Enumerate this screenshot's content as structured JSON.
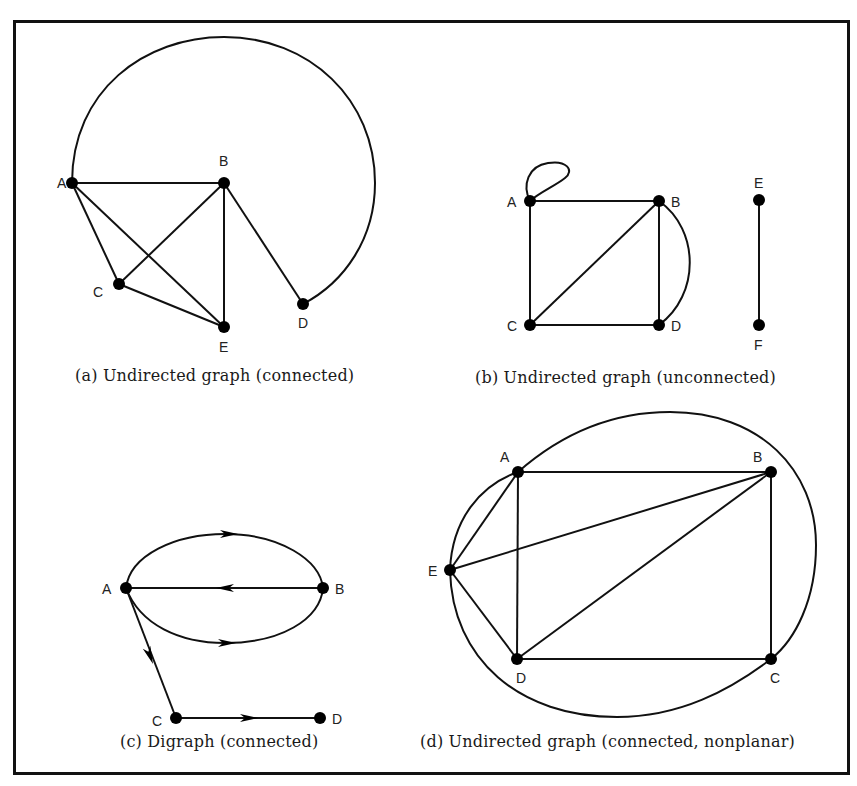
{
  "figure": {
    "title_clipped": "",
    "panels": [
      {
        "id": "a",
        "caption": "(a) Undirected graph (connected)",
        "directed": false,
        "nodes": [
          {
            "label": "A",
            "x": 72,
            "y": 183,
            "lx": 57,
            "ly": 188
          },
          {
            "label": "B",
            "x": 224,
            "y": 183,
            "lx": 219,
            "ly": 166
          },
          {
            "label": "C",
            "x": 119,
            "y": 284,
            "lx": 93,
            "ly": 297
          },
          {
            "label": "D",
            "x": 303,
            "y": 304,
            "lx": 298,
            "ly": 328
          },
          {
            "label": "E",
            "x": 224,
            "y": 327,
            "lx": 219,
            "ly": 352
          }
        ],
        "edges": [
          {
            "from": "A",
            "to": "B"
          },
          {
            "from": "A",
            "to": "C"
          },
          {
            "from": "A",
            "to": "E"
          },
          {
            "from": "B",
            "to": "C"
          },
          {
            "from": "B",
            "to": "E"
          },
          {
            "from": "B",
            "to": "D"
          },
          {
            "from": "C",
            "to": "E"
          },
          {
            "from": "A",
            "to": "D",
            "curve": "large-arc"
          }
        ]
      },
      {
        "id": "b",
        "caption": "(b) Undirected graph (unconnected)",
        "directed": false,
        "nodes": [
          {
            "label": "A",
            "x": 530,
            "y": 201,
            "lx": 507,
            "ly": 207
          },
          {
            "label": "B",
            "x": 659,
            "y": 201,
            "lx": 671,
            "ly": 207
          },
          {
            "label": "C",
            "x": 530,
            "y": 325,
            "lx": 507,
            "ly": 331
          },
          {
            "label": "D",
            "x": 659,
            "y": 325,
            "lx": 671,
            "ly": 331
          },
          {
            "label": "E",
            "x": 759,
            "y": 200,
            "lx": 754,
            "ly": 188
          },
          {
            "label": "F",
            "x": 759,
            "y": 325,
            "lx": 754,
            "ly": 350
          }
        ],
        "edges": [
          {
            "from": "A",
            "to": "A",
            "curve": "loop"
          },
          {
            "from": "A",
            "to": "B"
          },
          {
            "from": "A",
            "to": "C"
          },
          {
            "from": "B",
            "to": "C"
          },
          {
            "from": "B",
            "to": "D"
          },
          {
            "from": "B",
            "to": "D",
            "curve": "arc"
          },
          {
            "from": "C",
            "to": "D"
          },
          {
            "from": "E",
            "to": "F"
          }
        ]
      },
      {
        "id": "c",
        "caption": "(c) Digraph (connected)",
        "directed": true,
        "nodes": [
          {
            "label": "A",
            "x": 126,
            "y": 588,
            "lx": 102,
            "ly": 594
          },
          {
            "label": "B",
            "x": 323,
            "y": 588,
            "lx": 335,
            "ly": 594
          },
          {
            "label": "C",
            "x": 176,
            "y": 718,
            "lx": 152,
            "ly": 726
          },
          {
            "label": "D",
            "x": 320,
            "y": 718,
            "lx": 332,
            "ly": 724
          }
        ],
        "edges": [
          {
            "from": "A",
            "to": "B",
            "curve": "upper-arc"
          },
          {
            "from": "B",
            "to": "A"
          },
          {
            "from": "A",
            "to": "B",
            "curve": "lower-arc"
          },
          {
            "from": "A",
            "to": "C"
          },
          {
            "from": "C",
            "to": "D"
          }
        ]
      },
      {
        "id": "d",
        "caption": "(d) Undirected graph (connected, nonplanar)",
        "directed": false,
        "nodes": [
          {
            "label": "A",
            "x": 518,
            "y": 472,
            "lx": 500,
            "ly": 462
          },
          {
            "label": "B",
            "x": 771,
            "y": 472,
            "lx": 753,
            "ly": 462
          },
          {
            "label": "C",
            "x": 771,
            "y": 659,
            "lx": 770,
            "ly": 683
          },
          {
            "label": "D",
            "x": 517,
            "y": 659,
            "lx": 516,
            "ly": 683
          },
          {
            "label": "E",
            "x": 450,
            "y": 570,
            "lx": 428,
            "ly": 576
          }
        ],
        "edges": [
          {
            "from": "A",
            "to": "B"
          },
          {
            "from": "A",
            "to": "D"
          },
          {
            "from": "A",
            "to": "E"
          },
          {
            "from": "E",
            "to": "B"
          },
          {
            "from": "E",
            "to": "D"
          },
          {
            "from": "B",
            "to": "D"
          },
          {
            "from": "B",
            "to": "C"
          },
          {
            "from": "D",
            "to": "C"
          },
          {
            "from": "E",
            "to": "A",
            "curve": "outer-arc"
          },
          {
            "from": "A",
            "to": "C",
            "curve": "outer-arc"
          },
          {
            "from": "C",
            "to": "E",
            "curve": "outer-arc"
          }
        ]
      }
    ]
  }
}
